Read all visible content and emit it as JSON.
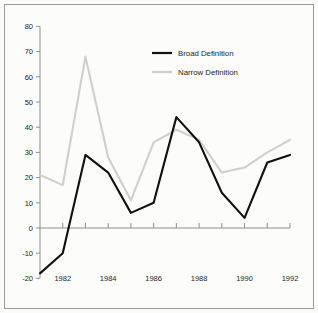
{
  "chart_data": {
    "type": "line",
    "title": "",
    "subtitle": "",
    "xlabel": "",
    "ylabel": "",
    "x": [
      1981,
      1982,
      1983,
      1984,
      1985,
      1986,
      1987,
      1988,
      1989,
      1990,
      1991,
      1992
    ],
    "xlim": [
      1981,
      1992
    ],
    "ylim": [
      -20,
      80
    ],
    "grid": false,
    "legend_position": "upper-center",
    "x_tick_values": [
      1981,
      1982,
      1983,
      1984,
      1985,
      1986,
      1987,
      1988,
      1989,
      1990,
      1991,
      1992
    ],
    "x_tick_labels": [
      "",
      "1982",
      "",
      "1984",
      "",
      "1986",
      "",
      "1988",
      "",
      "1990",
      "",
      "1992"
    ],
    "y_tick_values": [
      -20,
      -10,
      0,
      10,
      20,
      30,
      40,
      50,
      60,
      70,
      80
    ],
    "y_tick_labels": [
      "-20",
      "-10",
      "0",
      "10",
      "20",
      "30",
      "40",
      "50",
      "60",
      "70",
      "80"
    ],
    "series": [
      {
        "name": "Broad Definition",
        "color": "#111111",
        "values": [
          -18,
          -10,
          29,
          22,
          6,
          10,
          44,
          34,
          14,
          4,
          26,
          29
        ]
      },
      {
        "name": "Narrow Definition",
        "color": "#cfcfcf",
        "values": [
          21,
          17,
          68,
          28,
          11,
          34,
          39,
          35,
          22,
          24,
          30,
          35
        ]
      }
    ]
  },
  "legend": {
    "entries": [
      {
        "label": "Broad Definition",
        "color": "#111111"
      },
      {
        "label": "Narrow Definition",
        "color": "#cfcfcf"
      }
    ]
  },
  "colors": {
    "broad": "#111111",
    "narrow": "#cfcfcf",
    "axis": "#8f8f8f",
    "border": "#9a9a9a",
    "background": "#fcfcfb",
    "text": "#1c1c1c"
  }
}
